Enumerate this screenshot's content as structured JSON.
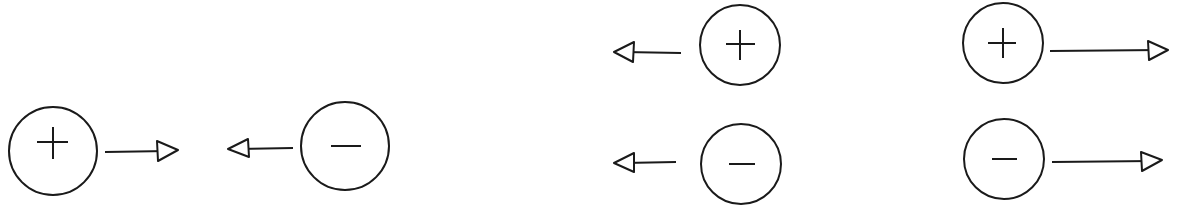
{
  "diagram": {
    "groups": [
      {
        "id": "attraction-pair",
        "charges": [
          {
            "sign": "+",
            "cx": 53,
            "cy": 151,
            "r": 44,
            "arrow": {
              "direction": "right",
              "x1": 105,
              "x2": 178,
              "y": 152
            }
          },
          {
            "sign": "-",
            "cx": 345,
            "cy": 146,
            "r": 44,
            "arrow": {
              "direction": "left",
              "x1": 293,
              "x2": 228,
              "y": 148
            }
          }
        ]
      },
      {
        "id": "left-pointing-column",
        "charges": [
          {
            "sign": "+",
            "cx": 740,
            "cy": 45,
            "r": 40,
            "arrow": {
              "direction": "left",
              "x1": 681,
              "x2": 614,
              "y": 52
            }
          },
          {
            "sign": "-",
            "cx": 741,
            "cy": 164,
            "r": 40,
            "arrow": {
              "direction": "left",
              "x1": 676,
              "x2": 614,
              "y": 163
            }
          }
        ]
      },
      {
        "id": "right-pointing-column",
        "charges": [
          {
            "sign": "+",
            "cx": 1043,
            "cy": 43,
            "r": 40,
            "arrow": {
              "direction": "right",
              "x1": 1050,
              "x2": 1115,
              "y": 50
            }
          },
          {
            "sign": "-",
            "cx": 1045,
            "cy": 159,
            "r": 40,
            "arrow": {
              "direction": "right",
              "x1": 1052,
              "x2": 1110,
              "y": 161
            }
          }
        ]
      }
    ],
    "stroke_color": "#1a1a1a",
    "background": "#ffffff"
  }
}
